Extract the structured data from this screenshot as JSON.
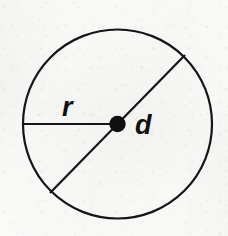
{
  "figure": {
    "kind": "geometry-diagram",
    "title": "Circle showing radius r and diameter d",
    "background_color": "#f8f8f6",
    "ink_color": "#151515",
    "canvas": {
      "width": 228,
      "height": 236
    },
    "circle": {
      "name": "circle-outline",
      "center_x": 117.5,
      "center_y": 124,
      "radius": 94.5,
      "stroke_width": 2.2,
      "fill": "none"
    },
    "center_point": {
      "name": "center-point-dot",
      "x": 117.5,
      "y": 124,
      "radius": 8.2,
      "fill": "#101010"
    },
    "segments": [
      {
        "id": "radius",
        "name": "radius-segment",
        "label": "r",
        "x1": 23,
        "y1": 124,
        "x2": 117.5,
        "y2": 124,
        "stroke_width": 2.2,
        "angle_degrees": 180
      },
      {
        "id": "diameter",
        "name": "diameter-segment",
        "label": "d",
        "x1": 185,
        "y1": 55,
        "x2": 50,
        "y2": 193,
        "stroke_width": 2.2,
        "angle_degrees": 134
      }
    ],
    "labels": [
      {
        "id": "label-r",
        "name": "radius-label",
        "text": "r",
        "x": 62,
        "y": 116,
        "font_size": 27,
        "style": "bold-italic"
      },
      {
        "id": "label-d",
        "name": "diameter-label",
        "text": "d",
        "x": 135,
        "y": 134,
        "font_size": 27,
        "style": "bold-italic"
      }
    ]
  }
}
